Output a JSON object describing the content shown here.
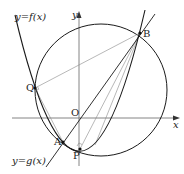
{
  "diagram": {
    "curves": {
      "f_label": "y=f(x)",
      "g_label": "y=g(x)"
    },
    "axes": {
      "x_label": "x",
      "y_label": "y",
      "origin_label": "O"
    },
    "points": {
      "B": "B",
      "Q": "Q",
      "A": "A",
      "P": "P"
    },
    "colors": {
      "curve": "#1a1a1a",
      "axis": "#555555",
      "thin_line": "#777777",
      "background": "#ffffff"
    }
  }
}
